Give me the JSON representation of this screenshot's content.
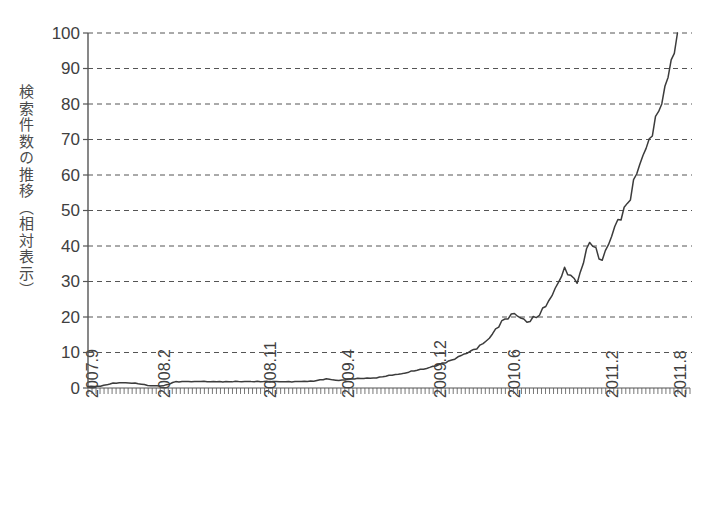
{
  "chart_data": {
    "type": "line",
    "title": "",
    "subtitle": "",
    "xlabel": "",
    "ylabel": "検索件数の推移（相対表示）",
    "ylim": [
      0,
      100
    ],
    "y_ticks": [
      0,
      10,
      20,
      30,
      40,
      50,
      60,
      70,
      80,
      90,
      100
    ],
    "x_tick_labels": [
      "2007.9",
      "2008.2",
      "2008.11",
      "2009.4",
      "2009.12",
      "2010.6",
      "2011.2",
      "2011.8"
    ],
    "x_tick_positions_months": [
      0,
      5,
      14,
      19,
      27,
      33,
      41,
      47
    ],
    "x_range_months": [
      0,
      48
    ],
    "grid": "horizontal-dashed",
    "legend": "none",
    "line_color": "#3c3c3c",
    "grid_color": "#555555",
    "axis_color": "#555555",
    "series": [
      {
        "name": "検索件数の推移（相対表示）",
        "x_months": [
          0,
          1,
          2,
          3,
          4,
          5,
          6,
          7,
          8,
          9,
          10,
          11,
          12,
          13,
          14,
          15,
          16,
          17,
          18,
          19,
          20,
          21,
          22,
          23,
          24,
          25,
          26,
          27,
          28,
          29,
          30,
          31,
          32,
          33,
          34,
          35,
          36,
          37,
          38,
          39,
          40,
          41,
          42,
          43,
          44,
          45,
          46,
          47
        ],
        "values": [
          0.4,
          0.5,
          1.4,
          1.5,
          1.2,
          0.6,
          0.6,
          1.8,
          1.8,
          1.8,
          1.8,
          1.8,
          1.8,
          1.8,
          1.8,
          1.8,
          1.8,
          1.8,
          1.9,
          2.6,
          2.1,
          2.6,
          2.7,
          2.8,
          3.6,
          4.0,
          4.8,
          5.5,
          6.6,
          7.9,
          9.6,
          11.0,
          14.0,
          19.0,
          21.0,
          18.5,
          20.5,
          26.0,
          34.0,
          29.5,
          41.0,
          36.0,
          45.5,
          52.0,
          63.0,
          71.0,
          85.0,
          100.0
        ]
      }
    ]
  },
  "axis": {
    "y_tick_labels": [
      "100",
      "90",
      "80",
      "70",
      "60",
      "50",
      "40",
      "30",
      "20",
      "10",
      "0"
    ],
    "x_tick_labels": [
      "2007.9",
      "2008.2",
      "2008.11",
      "2009.4",
      "2009.12",
      "2010.6",
      "2011.2",
      "2011.8"
    ]
  },
  "ylabel": {
    "text": "検索件数の推移（相対表示）"
  }
}
